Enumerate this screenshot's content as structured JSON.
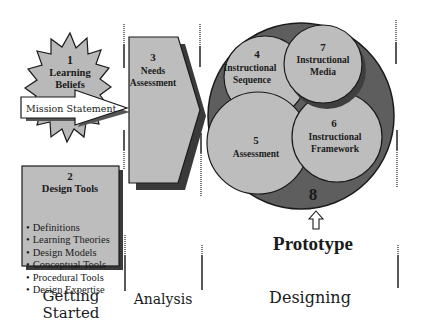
{
  "diagram": {
    "colors": {
      "shape_fill": "#bdbdbd",
      "shape_shadow": "#4a4a4a",
      "outer_circle": "#5c5c5c",
      "outline": "#1a1a1a",
      "arrow_fill": "#ffffff"
    },
    "nodes": {
      "learning_beliefs": {
        "number": "1",
        "line1": "Learning",
        "line2": "Beliefs"
      },
      "mission_statement": {
        "label": "Mission Statement"
      },
      "design_tools": {
        "number": "2",
        "title": "Design Tools",
        "items": [
          "Definitions",
          "Learning Theories",
          "Design Models",
          "Conceptual Tools",
          "Procedural Tools",
          "Design Expertise"
        ]
      },
      "needs_assessment": {
        "number": "3",
        "line1": "Needs",
        "line2": "Assessment"
      },
      "instructional_sequence": {
        "number": "4",
        "line1": "Instructional",
        "line2": "Sequence"
      },
      "assessment": {
        "number": "5",
        "line1": "Assessment"
      },
      "instructional_framework": {
        "number": "6",
        "line1": "Instructional",
        "line2": "Framework"
      },
      "instructional_media": {
        "number": "7",
        "line1": "Instructional",
        "line2": "Media"
      },
      "designing_whole": {
        "number": "8"
      },
      "prototype": {
        "label": "Prototype"
      }
    },
    "phases": {
      "getting_started": {
        "line1": "Getting",
        "line2": "Started"
      },
      "analysis": {
        "label": "Analysis"
      },
      "designing": {
        "label": "Designing"
      }
    }
  }
}
